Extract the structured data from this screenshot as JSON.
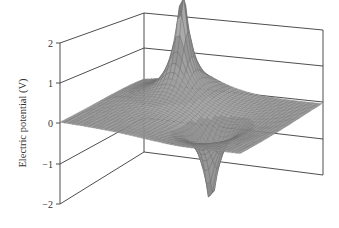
{
  "chart_data": {
    "type": "surface",
    "title": "",
    "zlabel": "Electric potential (V)",
    "xlabel": "",
    "ylabel": "",
    "z_ticks": [
      2,
      1,
      0,
      -1,
      -2
    ],
    "z_tick_labels": [
      "2",
      "1",
      "0",
      "−1",
      "−2"
    ],
    "zlim": [
      -2,
      2
    ],
    "grid": false,
    "sources": [
      {
        "name": "positive-charge-peak",
        "u": 0.8,
        "v": 0.31,
        "peak_value": 2.7
      },
      {
        "name": "negative-charge-trough",
        "u": 0.42,
        "v": 0.645,
        "peak_value": -2.1
      }
    ],
    "colors": {
      "surface_fill": "#a8a8a8",
      "mesh_line": "#6a6a6a",
      "frame": "#3a3a3a",
      "background": "#ffffff"
    }
  }
}
